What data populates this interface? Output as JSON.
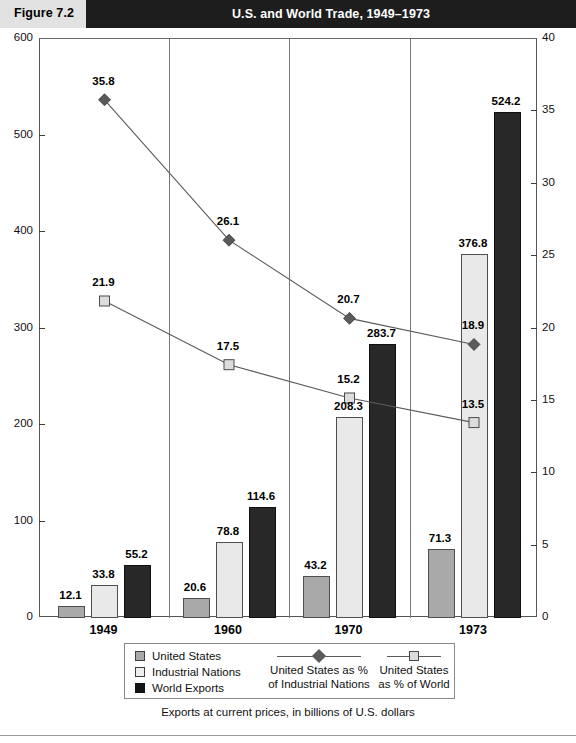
{
  "header": {
    "figure_label": "Figure 7.2",
    "title": "U.S. and World Trade, 1949–1973"
  },
  "caption": "Exports at current prices, in billions of U.S. dollars",
  "legend": {
    "bar_items": [
      {
        "label": "United States",
        "swatch": "us",
        "color": "#a9a9a9"
      },
      {
        "label": "Industrial Nations",
        "swatch": "ind",
        "color": "#efefef"
      },
      {
        "label": "World Exports",
        "swatch": "world",
        "color": "#141414"
      }
    ],
    "line_items": [
      {
        "label_line1": "United States as %",
        "label_line2": "of Industrial Nations",
        "marker": "diamond"
      },
      {
        "label_line1": "United States",
        "label_line2": "as % of World",
        "marker": "square"
      }
    ]
  },
  "chart_data": {
    "type": "bar",
    "title": "U.S. and World Trade, 1949–1973",
    "subtitle": "Exports at current prices, in billions of U.S. dollars",
    "xlabel": "",
    "ylabel": "",
    "categories": [
      "1949",
      "1960",
      "1970",
      "1973"
    ],
    "grid": false,
    "legend_position": "bottom",
    "left_axis": {
      "label": "Billions of U.S. dollars",
      "ylim": [
        0,
        600
      ],
      "ticks": [
        0,
        100,
        200,
        300,
        400,
        500,
        600
      ],
      "tick_labels": [
        "0",
        "100",
        "200",
        "300",
        "400",
        "500",
        "600"
      ]
    },
    "right_axis": {
      "label": "Percent",
      "ylim": [
        0,
        40
      ],
      "ticks": [
        0,
        5,
        10,
        15,
        20,
        25,
        30,
        35,
        40
      ],
      "tick_labels": [
        "0",
        "5",
        "10",
        "15",
        "20",
        "25",
        "30",
        "35",
        "40"
      ]
    },
    "series": [
      {
        "name": "United States",
        "kind": "bar",
        "axis": "left",
        "color": "#a9a9a9",
        "values": [
          12.1,
          20.6,
          43.2,
          71.3
        ],
        "labels": [
          "12.1",
          "20.6",
          "43.2",
          "71.3"
        ]
      },
      {
        "name": "Industrial Nations",
        "kind": "bar",
        "axis": "left",
        "color": "#e9e9e9",
        "values": [
          33.8,
          78.8,
          208.3,
          376.8
        ],
        "labels": [
          "33.8",
          "78.8",
          "208.3",
          "376.8"
        ]
      },
      {
        "name": "World Exports",
        "kind": "bar",
        "axis": "left",
        "color": "#282828",
        "values": [
          55.2,
          114.6,
          283.7,
          524.2
        ],
        "labels": [
          "55.2",
          "114.6",
          "283.7",
          "524.2"
        ]
      },
      {
        "name": "United States as % of Industrial Nations",
        "kind": "line",
        "axis": "right",
        "marker": "diamond",
        "color": "#5a5a5a",
        "values": [
          35.8,
          26.1,
          20.7,
          18.9
        ],
        "labels": [
          "35.8",
          "26.1",
          "20.7",
          "18.9"
        ]
      },
      {
        "name": "United States as % of World",
        "kind": "line",
        "axis": "right",
        "marker": "square",
        "color": "#dcdcdc",
        "values": [
          21.9,
          17.5,
          15.2,
          13.5
        ],
        "labels": [
          "21.9",
          "17.5",
          "15.2",
          "13.5"
        ]
      }
    ]
  }
}
